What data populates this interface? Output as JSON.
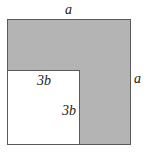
{
  "diagram": {
    "type": "geometry",
    "outer_square": {
      "side_label": "a",
      "fill": "#b4b4b4",
      "stroke": "#5a5a5a"
    },
    "inner_square": {
      "side_label": "3b",
      "fill": "#ffffff",
      "stroke": "#5a5a5a"
    },
    "labels": {
      "top": "a",
      "right": "a",
      "inner_top": "3b",
      "inner_right": "3b"
    }
  }
}
